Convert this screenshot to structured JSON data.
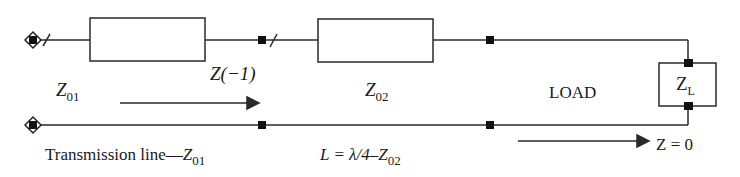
{
  "diagram": {
    "colors": {
      "line": "#2a2a2a",
      "node": "#111111",
      "background": "#ffffff"
    },
    "labels": {
      "z01_letter": "Z",
      "z01_sub": "01",
      "z_minus1": "Z(−1)",
      "z02_letter": "Z",
      "z02_sub": "02",
      "load": "LOAD",
      "zl_letter": "Z",
      "zl_sub": "L",
      "tline_text": "Transmission line—",
      "tline_letter": "Z",
      "tline_sub": "01",
      "quarter_text": "L = λ/4–",
      "quarter_letter": "Z",
      "quarter_sub": "02",
      "z0": "Z = 0"
    },
    "components": [
      {
        "id": "line-1",
        "type": "impedance-box",
        "label": "Z01"
      },
      {
        "id": "line-2",
        "type": "impedance-box",
        "label": "Z02"
      },
      {
        "id": "load",
        "type": "load-box",
        "label": "ZL"
      }
    ]
  }
}
